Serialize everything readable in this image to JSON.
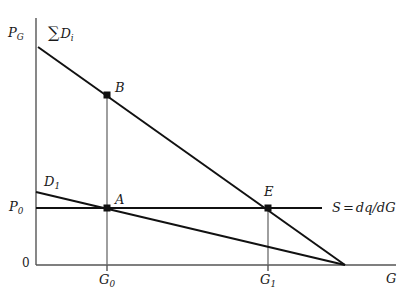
{
  "figure": {
    "type": "economics-supply-demand-diagram",
    "background": "#ffffff",
    "line_color": "#111111",
    "axis_color": "#555555",
    "width": 410,
    "height": 300
  },
  "axes": {
    "y_label": "P",
    "y_label_sub": "G",
    "x_label": "G",
    "origin_label": "0",
    "x_axis_y": 265,
    "y_axis_x": 36,
    "x_axis_end": 396,
    "y_axis_top": 18
  },
  "ticks": {
    "x": [
      {
        "label": "G",
        "sub": "0",
        "x": 107
      },
      {
        "label": "G",
        "sub": "1",
        "x": 268
      }
    ],
    "y": [
      {
        "label": "P",
        "sub": "0",
        "y": 208
      }
    ]
  },
  "curves": [
    {
      "name": "aggregate-demand",
      "label_glyph": "∑",
      "label": "D",
      "label_sub": "i",
      "x1": 38,
      "y1": 47,
      "x2": 345,
      "y2": 265,
      "label_x": 48,
      "label_y": 26
    },
    {
      "name": "individual-demand",
      "label": "D",
      "label_sub": "1",
      "x1": 36,
      "y1": 192,
      "x2": 345,
      "y2": 265,
      "label_x": 44,
      "label_y": 176
    },
    {
      "name": "supply",
      "label": "S",
      "equation_lhs": "S",
      "equation_op": "=",
      "equation_rhs": "dq/dG",
      "x1": 36,
      "y1": 208,
      "x2": 322,
      "y2": 208,
      "label_x": 332,
      "label_y": 201
    }
  ],
  "points": [
    {
      "name": "point-b",
      "label": "B",
      "x": 107,
      "y": 95,
      "label_x": 115,
      "label_y": 82
    },
    {
      "name": "point-a",
      "label": "A",
      "x": 107,
      "y": 208,
      "label_x": 115,
      "label_y": 194
    },
    {
      "name": "point-e",
      "label": "E",
      "x": 268,
      "y": 208,
      "label_x": 264,
      "label_y": 186
    }
  ],
  "guides": [
    {
      "name": "guide-g0",
      "x": 107,
      "y_top": 95,
      "y_bottom": 265
    },
    {
      "name": "guide-g1",
      "x": 268,
      "y_top": 208,
      "y_bottom": 265
    }
  ]
}
